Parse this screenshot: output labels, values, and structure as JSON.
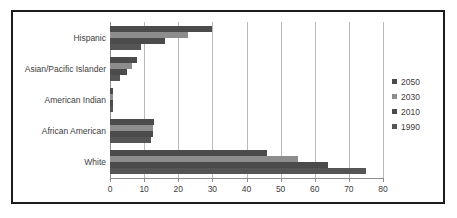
{
  "chart_data": {
    "type": "bar",
    "orientation": "horizontal",
    "title": "",
    "xlabel": "",
    "ylabel": "",
    "categories": [
      "Hispanic",
      "Asian/Pacific Islander",
      "American Indian",
      "African American",
      "White"
    ],
    "series": [
      {
        "name": "2050",
        "color": "#4b4b4b",
        "values": [
          30,
          8,
          1,
          13,
          46
        ]
      },
      {
        "name": "2030",
        "color": "#8d8d8d",
        "values": [
          23,
          6.5,
          1,
          12.5,
          55
        ]
      },
      {
        "name": "2010",
        "color": "#4b4b4b",
        "values": [
          16,
          5,
          0.9,
          12.5,
          64
        ]
      },
      {
        "name": "1990",
        "color": "#555555",
        "values": [
          9,
          3,
          0.8,
          12,
          75
        ]
      }
    ],
    "xlim": [
      0,
      80
    ],
    "xticks": [
      0,
      10,
      20,
      30,
      40,
      50,
      60,
      70,
      80
    ],
    "xtick_labels": [
      "0",
      "10",
      "20",
      "30",
      "40",
      "50",
      "60",
      "70",
      "80"
    ],
    "grid": true,
    "grid_axis": "x",
    "legend": {
      "position": "right",
      "entries": [
        {
          "label": "2050",
          "color": "#4b4b4b"
        },
        {
          "label": "2030",
          "color": "#8d8d8d"
        },
        {
          "label": "2010",
          "color": "#4b4b4b"
        },
        {
          "label": "1990",
          "color": "#555555"
        }
      ]
    },
    "colors": {
      "grid": "#b9b9b9",
      "axis": "#8f8f8f",
      "text": "#3d3d3d",
      "frame": "#1c1c1c",
      "background": "#ffffff"
    }
  }
}
